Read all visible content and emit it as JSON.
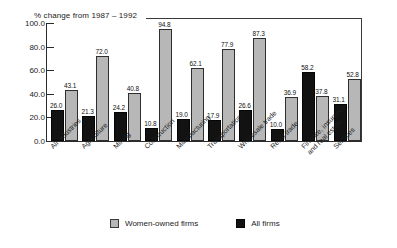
{
  "chart_data": {
    "type": "bar",
    "title": "% change from 1987 – 1992",
    "xlabel": "",
    "ylabel": "",
    "ylim": [
      0.0,
      100.0
    ],
    "ytick_labels": [
      "100.0",
      "80.0",
      "60.0",
      "40.0",
      "20.0",
      "0.0"
    ],
    "ytick_values": [
      100.0,
      80.0,
      60.0,
      40.0,
      20.0,
      0.0
    ],
    "grid": false,
    "legend_position": "bottom-center",
    "categories": [
      "All industries",
      "Agriculture",
      "Mining",
      "Construction",
      "Manufacturing",
      "Transportation",
      "Wholesale trade",
      "Retail trade",
      "Finance, insurance, and real estate",
      "Services"
    ],
    "series": [
      {
        "name": "All firms",
        "color": "#121212",
        "values": [
          26.0,
          21.3,
          24.2,
          10.8,
          19.0,
          17.9,
          26.6,
          10.0,
          58.2,
          31.1
        ],
        "labels": [
          "26.0",
          "21.3",
          "24.2",
          "10.8",
          "19.0",
          "17.9",
          "26.6",
          "10.0",
          "58.2",
          "31.1"
        ]
      },
      {
        "name": "Women-owned firms",
        "color": "#b7b7b7",
        "values": [
          43.1,
          72.0,
          40.8,
          94.8,
          62.1,
          77.9,
          87.3,
          36.9,
          37.8,
          52.8
        ],
        "labels": [
          "43.1",
          "72.0",
          "40.8",
          "94.8",
          "62.1",
          "77.9",
          "87.3",
          "36.9",
          "37.8",
          "52.8"
        ]
      }
    ]
  },
  "legend": {
    "items": [
      {
        "label": "Women-owned firms",
        "swatch": "grey"
      },
      {
        "label": "All firms",
        "swatch": "black"
      }
    ]
  }
}
